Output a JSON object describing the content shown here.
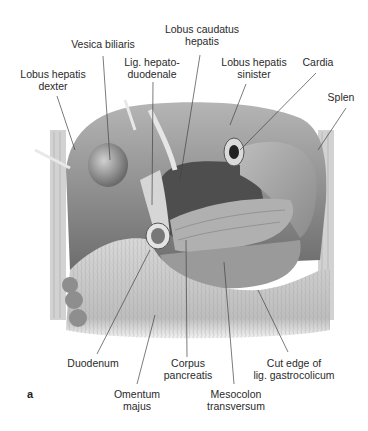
{
  "figure": {
    "letter": "a"
  },
  "labels": {
    "vesica_biliaris": {
      "line1": "Vesica biliaris",
      "line2": ""
    },
    "lobus_caudatus": {
      "line1": "Lobus caudatus",
      "line2": "hepatis"
    },
    "lobus_dexter": {
      "line1": "Lobus hepatis",
      "line2": "dexter"
    },
    "lig_hepatoduodenale": {
      "line1": "Lig. hepato-",
      "line2": "duodenale"
    },
    "lobus_sinister": {
      "line1": "Lobus hepatis",
      "line2": "sinister"
    },
    "cardia": {
      "line1": "Cardia",
      "line2": ""
    },
    "splen": {
      "line1": "Splen",
      "line2": ""
    },
    "duodenum": {
      "line1": "Duodenum",
      "line2": ""
    },
    "corpus_pancreatis": {
      "line1": "Corpus",
      "line2": "pancreatis"
    },
    "cut_edge": {
      "line1": "Cut edge of",
      "line2": "lig. gastrocolicum"
    },
    "omentum_majus": {
      "line1": "Omentum",
      "line2": "majus"
    },
    "mesocolon": {
      "line1": "Mesocolon",
      "line2": "transversum"
    }
  },
  "colors": {
    "text": "#2a2a2a",
    "leader_line": "#444444",
    "liver": "#8a8a8a",
    "omentum": "#cfcfcf",
    "background": "#ffffff"
  }
}
